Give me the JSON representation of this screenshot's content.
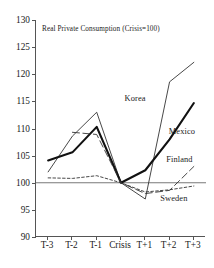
{
  "chart_data": {
    "type": "line",
    "title": "Real Private Consumption (Crisis=100)",
    "xlabel": "",
    "ylabel": "",
    "categories": [
      "T-3",
      "T-2",
      "T-1",
      "Crisis",
      "T+1",
      "T+2",
      "T+3"
    ],
    "ylim": [
      90,
      130
    ],
    "yticks": [
      90,
      95,
      100,
      105,
      110,
      115,
      120,
      125,
      130
    ],
    "grid": false,
    "legend_position": "inline-annotations",
    "reference_line": 100,
    "series": [
      {
        "name": "Korea",
        "style": "thin-solid",
        "color": "#333333",
        "values": [
          102.0,
          108.6,
          113.0,
          100.0,
          97.0,
          118.6,
          122.2
        ]
      },
      {
        "name": "Mexico",
        "style": "thick-solid",
        "color": "#111111",
        "values": [
          104.1,
          105.6,
          110.3,
          100.0,
          102.3,
          108.0,
          114.7
        ]
      },
      {
        "name": "Finland",
        "style": "long-dash",
        "color": "#333333",
        "values": [
          null,
          109.3,
          108.9,
          100.0,
          98.0,
          98.6,
          103.0
        ]
      },
      {
        "name": "Sweden",
        "style": "short-dash",
        "color": "#333333",
        "values": [
          100.9,
          100.8,
          101.3,
          100.0,
          98.3,
          98.7,
          99.4
        ]
      }
    ],
    "annotations": [
      {
        "text": "Korea",
        "x": 4.12,
        "y": 115.6
      },
      {
        "text": "Mexico",
        "x": 6.05,
        "y": 109.6
      },
      {
        "text": "Finland",
        "x": 5.95,
        "y": 104.3
      },
      {
        "text": "Sweden",
        "x": 5.72,
        "y": 97.2
      }
    ]
  }
}
